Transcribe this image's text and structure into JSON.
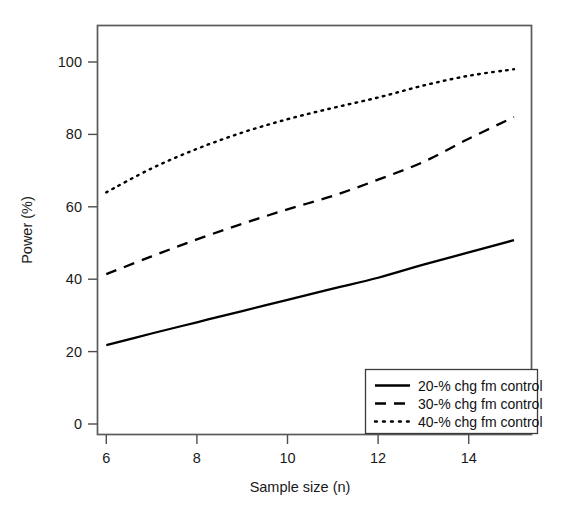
{
  "chart_data": {
    "type": "line",
    "title": "",
    "xlabel": "Sample size (n)",
    "ylabel": "Power (%)",
    "xlim": [
      5.6,
      15.3
    ],
    "ylim": [
      -3,
      107
    ],
    "grid": false,
    "legend_position": "bottom-right",
    "x": [
      6,
      7,
      8,
      9,
      10,
      11,
      12,
      13,
      14,
      15
    ],
    "xticks": [
      6,
      8,
      10,
      12,
      14
    ],
    "xticklabels": [
      "6",
      "8",
      "10",
      "12",
      "14"
    ],
    "yticks": [
      0,
      20,
      40,
      60,
      80,
      100
    ],
    "yticklabels": [
      "0",
      "20",
      "40",
      "60",
      "80",
      "100"
    ],
    "series": [
      {
        "name": "20-% chg fm control",
        "style": "solid",
        "color": "#000000",
        "values": [
          21.8,
          25.0,
          28.1,
          31.2,
          34.3,
          37.4,
          40.4,
          44.0,
          47.4,
          50.8
        ]
      },
      {
        "name": "30-% chg fm control",
        "style": "dashed",
        "color": "#000000",
        "values": [
          41.4,
          46.3,
          51.0,
          55.3,
          59.3,
          63.0,
          67.5,
          72.4,
          78.8,
          84.8
        ]
      },
      {
        "name": "40-% chg fm control",
        "style": "dotted",
        "color": "#000000",
        "values": [
          64.0,
          70.6,
          76.0,
          80.5,
          84.2,
          87.3,
          90.2,
          93.5,
          96.2,
          98.0
        ]
      }
    ]
  },
  "legend": {
    "entries": [
      {
        "label": "20-% chg fm control",
        "style": "solid"
      },
      {
        "label": "30-% chg fm control",
        "style": "dashed"
      },
      {
        "label": "40-% chg fm control",
        "style": "dotted"
      }
    ]
  }
}
